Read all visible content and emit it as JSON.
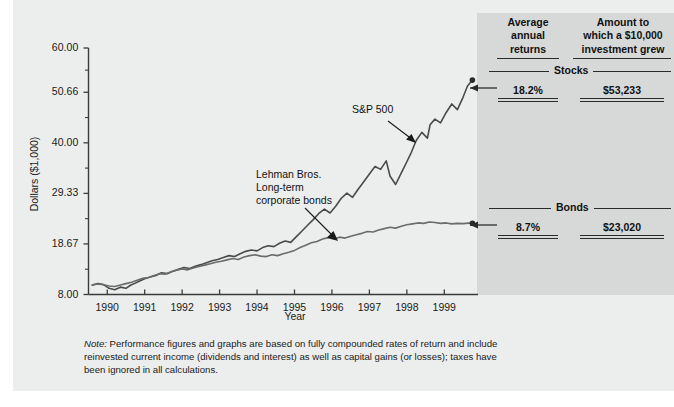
{
  "chart_data": {
    "type": "line",
    "title": "",
    "xlabel": "Year",
    "ylabel": "Dollars ($1,000)",
    "ylim": [
      8.0,
      60.0
    ],
    "xlim": [
      1989.5,
      1999.9
    ],
    "grid": false,
    "legend_position": "inline-annotations",
    "ytick_labels": [
      "60.00",
      "50.66",
      "40.00",
      "29.33",
      "18.67",
      "8.00"
    ],
    "ytick_values": [
      60.0,
      50.66,
      40.0,
      29.33,
      18.67,
      8.0
    ],
    "xtick_labels": [
      "1990",
      "1991",
      "1992",
      "1993",
      "1994",
      "1995",
      "1996",
      "1997",
      "1998",
      "1999"
    ],
    "xtick_values": [
      1990,
      1991,
      1992,
      1993,
      1994,
      1995,
      1996,
      1997,
      1998,
      1999
    ],
    "annotations": [
      {
        "text": "S&P 500",
        "x": 1996.6,
        "y": 44.0
      },
      {
        "text": "Lehman Bros. Long-term corporate bonds",
        "x": 1994.3,
        "y": 29.0
      }
    ],
    "series": [
      {
        "name": "S&P 500",
        "color": "#4a4a4a",
        "final_value": 53.233,
        "x": [
          1989.6,
          1989.75,
          1989.9,
          1990.05,
          1990.2,
          1990.35,
          1990.5,
          1990.62,
          1990.75,
          1990.88,
          1991.0,
          1991.15,
          1991.3,
          1991.45,
          1991.6,
          1991.75,
          1991.9,
          1992.05,
          1992.2,
          1992.35,
          1992.5,
          1992.65,
          1992.8,
          1992.95,
          1993.1,
          1993.25,
          1993.4,
          1993.55,
          1993.7,
          1993.85,
          1994.0,
          1994.15,
          1994.3,
          1994.45,
          1994.6,
          1994.75,
          1994.9,
          1995.05,
          1995.2,
          1995.35,
          1995.5,
          1995.65,
          1995.8,
          1995.95,
          1996.1,
          1996.25,
          1996.4,
          1996.55,
          1996.7,
          1996.85,
          1997.0,
          1997.15,
          1997.3,
          1997.45,
          1997.55,
          1997.7,
          1997.85,
          1998.0,
          1998.12,
          1998.25,
          1998.4,
          1998.55,
          1998.62,
          1998.75,
          1998.9,
          1999.05,
          1999.2,
          1999.35,
          1999.5,
          1999.62,
          1999.75
        ],
        "y": [
          10.0,
          10.3,
          10.1,
          9.3,
          9.0,
          9.55,
          9.3,
          9.95,
          10.4,
          10.9,
          11.3,
          11.7,
          12.0,
          12.6,
          12.4,
          12.9,
          13.3,
          13.7,
          13.5,
          13.95,
          14.3,
          14.7,
          15.1,
          15.4,
          15.8,
          16.2,
          16.0,
          16.6,
          17.1,
          17.4,
          17.2,
          17.9,
          18.3,
          18.1,
          18.8,
          19.3,
          19.0,
          20.2,
          21.4,
          22.6,
          23.8,
          25.1,
          26.0,
          25.2,
          26.6,
          28.3,
          29.4,
          28.5,
          30.2,
          31.8,
          33.4,
          35.0,
          34.4,
          36.2,
          33.0,
          31.2,
          33.6,
          36.0,
          38.0,
          40.5,
          42.2,
          41.0,
          43.8,
          45.0,
          44.2,
          46.4,
          48.2,
          47.0,
          49.6,
          52.0,
          53.23
        ]
      },
      {
        "name": "Lehman Bros. Long-term corporate bonds",
        "color": "#6b6b6b",
        "final_value": 23.02,
        "x": [
          1989.6,
          1989.75,
          1989.9,
          1990.05,
          1990.2,
          1990.35,
          1990.5,
          1990.65,
          1990.8,
          1990.95,
          1991.1,
          1991.25,
          1991.4,
          1991.55,
          1991.7,
          1991.85,
          1992.0,
          1992.15,
          1992.3,
          1992.45,
          1992.6,
          1992.75,
          1992.9,
          1993.05,
          1993.2,
          1993.35,
          1993.5,
          1993.65,
          1993.8,
          1993.95,
          1994.1,
          1994.25,
          1994.4,
          1994.55,
          1994.7,
          1994.85,
          1995.0,
          1995.15,
          1995.3,
          1995.45,
          1995.6,
          1995.75,
          1995.9,
          1996.05,
          1996.2,
          1996.35,
          1996.5,
          1996.65,
          1996.8,
          1996.95,
          1997.1,
          1997.25,
          1997.4,
          1997.55,
          1997.7,
          1997.85,
          1998.0,
          1998.15,
          1998.3,
          1998.45,
          1998.6,
          1998.75,
          1998.9,
          1999.05,
          1999.2,
          1999.35,
          1999.5,
          1999.65,
          1999.75
        ],
        "y": [
          10.0,
          10.2,
          10.05,
          9.8,
          9.7,
          10.0,
          10.3,
          10.6,
          11.0,
          11.4,
          11.6,
          12.0,
          12.4,
          12.3,
          12.8,
          13.1,
          13.4,
          13.2,
          13.6,
          13.9,
          14.2,
          14.5,
          14.8,
          15.0,
          15.3,
          15.6,
          15.4,
          15.9,
          16.2,
          16.4,
          16.1,
          16.0,
          16.4,
          16.2,
          16.6,
          16.9,
          17.3,
          17.9,
          18.4,
          18.9,
          19.2,
          19.7,
          20.0,
          19.7,
          20.1,
          19.9,
          20.3,
          20.6,
          20.9,
          21.3,
          21.2,
          21.6,
          21.9,
          22.2,
          22.0,
          22.4,
          22.7,
          22.9,
          23.1,
          23.0,
          23.3,
          23.2,
          23.0,
          23.1,
          22.9,
          23.0,
          22.95,
          23.05,
          23.02
        ]
      }
    ]
  },
  "results": {
    "header_returns": "Average annual returns",
    "header_returns_lines": [
      "Average",
      "annual",
      "returns"
    ],
    "header_grew": "Amount to which a $10,000 investment grew",
    "header_grew_lines": [
      "Amount to",
      "which a $10,000",
      "investment grew"
    ],
    "sections": [
      {
        "title": "Stocks",
        "average_annual_return": "18.2%",
        "amount_grew": "$53,233"
      },
      {
        "title": "Bonds",
        "average_annual_return": "8.7%",
        "amount_grew": "$23,020"
      }
    ]
  },
  "note": {
    "label": "Note:",
    "text": " Performance figures and graphs are based on fully compounded rates of return and include reinvested current income (dividends and interest) as well as capital gains (or losses); taxes have been ignored in all calculations."
  },
  "colors": {
    "page_background": "#eceeed",
    "panel_background": "#d7d9d8",
    "axis": "#3a3a3a",
    "stocks_line": "#4a4a4a",
    "bonds_line": "#6b6b6b",
    "text": "#1a1a1a"
  }
}
